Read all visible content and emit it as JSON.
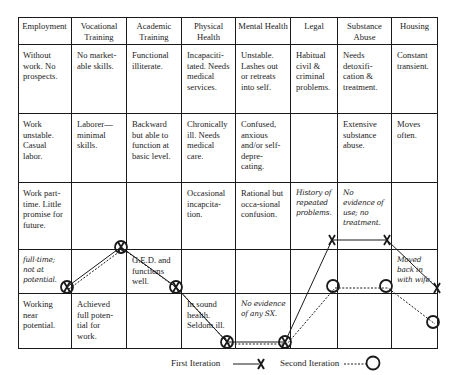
{
  "columns": [
    "Employment",
    "Vocational Training",
    "Academic Training",
    "Physical Health",
    "Mental Health",
    "Legal",
    "Substance Abuse",
    "Housing"
  ],
  "rows": [
    [
      "Without work. No prospects.",
      "No market-able skills.",
      "Functional illiterate.",
      "Incapaciti-tated. Needs medical services.",
      "Unstable. Lashes out or retreats into self.",
      "Habitual civil & criminal problems.",
      "Needs detoxifi-cation & treatment.",
      "Constant transient."
    ],
    [
      "Work unstable. Casual labor.",
      "Laborer—minimal skills.",
      "Backward but able to function at basic level.",
      "Chronically ill. Needs medical care.",
      "Confused, anxious and/or self-depre-cating.",
      "",
      "Extensive substance abuse.",
      "Moves often."
    ],
    [
      "Work part-time. Little promise for future.",
      "",
      "",
      "Occasional incapcita-tion.",
      "Rational but occa-sional confusion.",
      "History of repeated problems.",
      "No evidence of use; no treatment.",
      ""
    ],
    [
      "full-time; not at potential.",
      "",
      "G.E.D. and functions well.",
      "",
      "",
      "",
      "",
      "Moved back in with wife."
    ],
    [
      "Working near potential.",
      "Achieved full poten-tial for work.",
      "",
      "In sound health. Seldom ill.",
      "No evidence of any SX.",
      "",
      "",
      ""
    ]
  ],
  "handwritten_cells": [
    "2.5",
    "2.6",
    "3.0",
    "3.7",
    "4.4"
  ],
  "legend": {
    "first_iteration": "First Iteration",
    "second_iteration": "Second Iteration"
  },
  "series": [
    {
      "name": "First Iteration",
      "style": "solid",
      "marker": "X",
      "points": [
        [
          67,
          287
        ],
        [
          121,
          247
        ],
        [
          176,
          287
        ],
        [
          227,
          342
        ],
        [
          285,
          342
        ],
        [
          332,
          240
        ],
        [
          387,
          240
        ],
        [
          437,
          288
        ]
      ]
    },
    {
      "name": "Second Iteration",
      "style": "dashed",
      "marker": "O",
      "points": [
        [
          67,
          287
        ],
        [
          121,
          247
        ],
        [
          176,
          287
        ],
        [
          227,
          342
        ],
        [
          285,
          342
        ],
        [
          333,
          286
        ],
        [
          386,
          286
        ],
        [
          433,
          322
        ]
      ]
    }
  ],
  "colors": {
    "line": "#1a1a1a",
    "background": "#ffffff"
  }
}
